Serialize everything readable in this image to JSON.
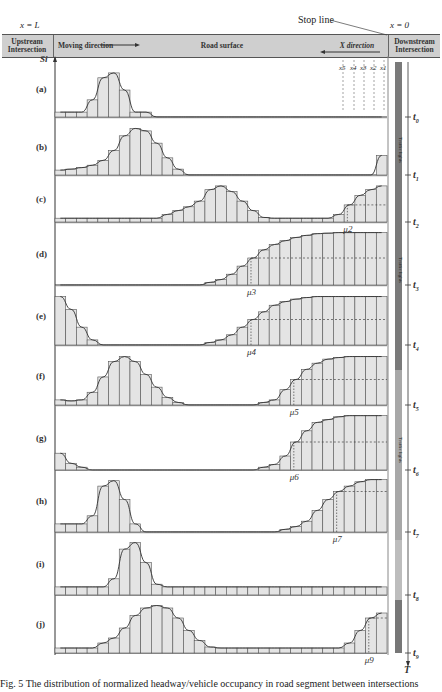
{
  "header": {
    "x_left": "x = L",
    "x_right": "x = 0",
    "stop_line": "Stop line",
    "upstream": "Upstream Intersection",
    "moving_direction": "Moving direction",
    "road_surface": "Road surface",
    "x_direction": "X direction",
    "downstream": "Downstream Intersection",
    "detectors": [
      "x5",
      "x4",
      "x3",
      "x2",
      "x1"
    ]
  },
  "axis": {
    "y_label": "S",
    "y_sub": "i",
    "time_label": "T"
  },
  "signal_bar": {
    "label": "Traffic lights",
    "segments": [
      {
        "from": 62,
        "to": 370,
        "color": "#7a7a7a"
      },
      {
        "from": 370,
        "to": 540,
        "color": "#a8a8a8"
      },
      {
        "from": 540,
        "to": 600,
        "color": "#bdbdbd"
      },
      {
        "from": 600,
        "to": 653,
        "color": "#777"
      }
    ]
  },
  "time_ticks": [
    {
      "label": "t0",
      "y": 117
    },
    {
      "label": "t1",
      "y": 175
    },
    {
      "label": "t2",
      "y": 222
    },
    {
      "label": "t3",
      "y": 285
    },
    {
      "label": "t4",
      "y": 345
    },
    {
      "label": "t5",
      "y": 405
    },
    {
      "label": "t6",
      "y": 470
    },
    {
      "label": "t7",
      "y": 532
    },
    {
      "label": "t8",
      "y": 595
    },
    {
      "label": "t9",
      "y": 653
    }
  ],
  "caption": "Fig. 5   The distribution of normalized headway/vehicle occupancy in road segment between intersections",
  "chart_data": {
    "type": "bar",
    "xlabel": "X direction (x = L to x = 0)",
    "ylabel": "S_i",
    "bins": 31,
    "panels": [
      {
        "label": "(a)",
        "top": 62,
        "bottom": 117,
        "mu": "",
        "values": [
          0.1,
          0.1,
          0.1,
          0.35,
          0.8,
          0.9,
          0.55,
          0.1,
          0.1,
          0,
          0,
          0,
          0,
          0,
          0,
          0,
          0,
          0,
          0,
          0,
          0,
          0,
          0,
          0,
          0,
          0,
          0,
          0,
          0,
          0,
          0
        ]
      },
      {
        "label": "(b)",
        "top": 120,
        "bottom": 175,
        "mu": "",
        "values": [
          0.1,
          0.12,
          0.15,
          0.2,
          0.3,
          0.5,
          0.8,
          0.95,
          0.9,
          0.65,
          0.35,
          0.12,
          0,
          0,
          0,
          0,
          0,
          0,
          0,
          0,
          0,
          0,
          0,
          0,
          0,
          0,
          0,
          0,
          0,
          0,
          0.4
        ]
      },
      {
        "label": "(c)",
        "top": 178,
        "bottom": 222,
        "mu": "μ2",
        "mu_bin": 27,
        "values": [
          0.1,
          0.1,
          0.1,
          0.1,
          0.1,
          0.1,
          0.1,
          0.1,
          0.1,
          0.1,
          0.2,
          0.3,
          0.4,
          0.55,
          0.85,
          0.95,
          0.8,
          0.55,
          0.3,
          0.12,
          0.1,
          0.1,
          0.1,
          0.1,
          0.1,
          0.1,
          0.2,
          0.45,
          0.7,
          0.85,
          0.95
        ]
      },
      {
        "label": "(d)",
        "top": 225,
        "bottom": 285,
        "mu": "μ3",
        "mu_bin": 18,
        "values": [
          0,
          0,
          0,
          0,
          0,
          0,
          0,
          0,
          0,
          0,
          0,
          0,
          0,
          0,
          0.05,
          0.1,
          0.2,
          0.35,
          0.5,
          0.65,
          0.75,
          0.82,
          0.88,
          0.92,
          0.95,
          0.96,
          0.97,
          0.97,
          0.97,
          0.97,
          0.97
        ]
      },
      {
        "label": "(e)",
        "top": 288,
        "bottom": 345,
        "mu": "μ4",
        "mu_bin": 18,
        "values": [
          0.95,
          0.7,
          0.35,
          0.1,
          0,
          0,
          0,
          0,
          0,
          0,
          0,
          0,
          0,
          0,
          0.05,
          0.1,
          0.2,
          0.35,
          0.5,
          0.65,
          0.78,
          0.85,
          0.9,
          0.93,
          0.95,
          0.95,
          0.95,
          0.95,
          0.95,
          0.95,
          0.95
        ]
      },
      {
        "label": "(f)",
        "top": 348,
        "bottom": 405,
        "mu": "μ5",
        "mu_bin": 22,
        "values": [
          0.1,
          0.08,
          0.1,
          0.25,
          0.55,
          0.85,
          0.95,
          0.85,
          0.6,
          0.35,
          0.15,
          0.05,
          0,
          0,
          0,
          0,
          0,
          0,
          0,
          0.05,
          0.1,
          0.3,
          0.5,
          0.7,
          0.82,
          0.9,
          0.93,
          0.95,
          0.95,
          0.95,
          0.95
        ]
      },
      {
        "label": "(g)",
        "top": 408,
        "bottom": 470,
        "mu": "μ6",
        "mu_bin": 22,
        "values": [
          0.3,
          0.12,
          0.05,
          0,
          0,
          0,
          0,
          0,
          0,
          0,
          0,
          0,
          0,
          0,
          0,
          0,
          0,
          0,
          0,
          0.05,
          0.1,
          0.25,
          0.5,
          0.7,
          0.85,
          0.9,
          0.95,
          0.97,
          0.97,
          0.97,
          0.97
        ]
      },
      {
        "label": "(h)",
        "top": 472,
        "bottom": 532,
        "mu": "μ7",
        "mu_bin": 26,
        "values": [
          0.15,
          0.15,
          0.15,
          0.3,
          0.85,
          0.95,
          0.6,
          0.15,
          0,
          0,
          0,
          0,
          0,
          0,
          0,
          0,
          0,
          0,
          0,
          0,
          0,
          0.05,
          0.1,
          0.2,
          0.4,
          0.6,
          0.75,
          0.85,
          0.93,
          0.97,
          0.97
        ]
      },
      {
        "label": "(i)",
        "top": 535,
        "bottom": 595,
        "mu": "",
        "values": [
          0.15,
          0.15,
          0.15,
          0.15,
          0.15,
          0.3,
          0.85,
          0.97,
          0.6,
          0.2,
          0.15,
          0.15,
          0.15,
          0.15,
          0.15,
          0.15,
          0.15,
          0.15,
          0.15,
          0.15,
          0.15,
          0.15,
          0.15,
          0.15,
          0.15,
          0.15,
          0.15,
          0.15,
          0.15,
          0.15,
          0.15
        ]
      },
      {
        "label": "(j)",
        "top": 597,
        "bottom": 653,
        "mu": "μ9",
        "mu_bin": 29,
        "values": [
          0.1,
          0.1,
          0.1,
          0.1,
          0.2,
          0.3,
          0.5,
          0.75,
          0.9,
          0.95,
          0.9,
          0.7,
          0.45,
          0.25,
          0.12,
          0.1,
          0.1,
          0.1,
          0.1,
          0.1,
          0.1,
          0.1,
          0.1,
          0.1,
          0.1,
          0.1,
          0.1,
          0.2,
          0.45,
          0.7,
          0.8
        ]
      }
    ]
  }
}
